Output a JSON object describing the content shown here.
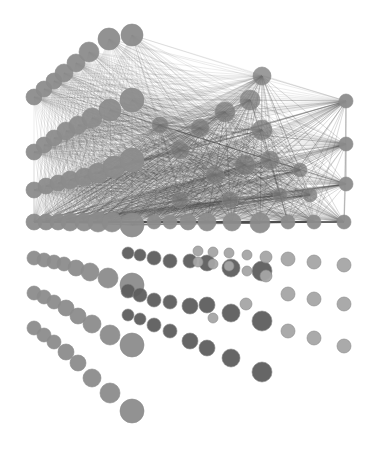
{
  "diagram": {
    "type": "network-graph",
    "width": 376,
    "height": 451,
    "colors": {
      "background": "#ffffff",
      "node_light": "#8c8c8c",
      "node_mid": "#7a7a7a",
      "node_dark": "#5e5e5e",
      "node_faint": "#a5a5a5",
      "edge": "#4a4a4a"
    },
    "node_groups": [
      {
        "name": "fan-row-1",
        "shade": "node_light",
        "nodes": [
          [
            34,
            97,
            8
          ],
          [
            44,
            89,
            8
          ],
          [
            54,
            81,
            8
          ],
          [
            64,
            73,
            9
          ],
          [
            76,
            63,
            9
          ],
          [
            89,
            52,
            10
          ],
          [
            109,
            39,
            11
          ],
          [
            132,
            35,
            11
          ]
        ]
      },
      {
        "name": "fan-row-2",
        "shade": "node_light",
        "nodes": [
          [
            34,
            152,
            8
          ],
          [
            44,
            145,
            8
          ],
          [
            54,
            138,
            8
          ],
          [
            66,
            131,
            9
          ],
          [
            78,
            125,
            9
          ],
          [
            92,
            118,
            10
          ],
          [
            110,
            110,
            11
          ],
          [
            132,
            100,
            12
          ]
        ]
      },
      {
        "name": "fan-row-3",
        "shade": "node_light",
        "nodes": [
          [
            34,
            190,
            8
          ],
          [
            46,
            186,
            8
          ],
          [
            58,
            183,
            8
          ],
          [
            70,
            180,
            9
          ],
          [
            84,
            177,
            9
          ],
          [
            98,
            173,
            10
          ],
          [
            114,
            167,
            11
          ],
          [
            132,
            160,
            12
          ]
        ]
      },
      {
        "name": "base-row",
        "shade": "node_light",
        "nodes": [
          [
            34,
            222,
            8
          ],
          [
            46,
            222,
            8
          ],
          [
            58,
            222,
            8
          ],
          [
            70,
            222,
            9
          ],
          [
            84,
            222,
            9
          ],
          [
            98,
            222,
            10
          ],
          [
            112,
            222,
            10
          ],
          [
            132,
            225,
            12
          ],
          [
            154,
            222,
            7
          ],
          [
            170,
            222,
            7
          ],
          [
            188,
            222,
            8
          ],
          [
            207,
            222,
            9
          ],
          [
            232,
            222,
            9
          ],
          [
            260,
            223,
            10
          ],
          [
            288,
            222,
            7
          ],
          [
            314,
            222,
            7
          ],
          [
            344,
            222,
            7
          ]
        ]
      },
      {
        "name": "hub-top",
        "shade": "node_mid",
        "nodes": [
          [
            262,
            76,
            9
          ]
        ]
      },
      {
        "name": "right-column",
        "shade": "node_light",
        "nodes": [
          [
            346,
            101,
            7
          ],
          [
            346,
            144,
            7
          ],
          [
            346,
            184,
            7
          ]
        ]
      },
      {
        "name": "dense-cluster-inner",
        "shade": "node_mid",
        "nodes": [
          [
            160,
            125,
            8
          ],
          [
            180,
            150,
            9
          ],
          [
            200,
            128,
            9
          ],
          [
            225,
            112,
            10
          ],
          [
            250,
            100,
            10
          ],
          [
            262,
            130,
            10
          ],
          [
            215,
            175,
            9
          ],
          [
            245,
            165,
            10
          ],
          [
            270,
            160,
            9
          ],
          [
            300,
            170,
            7
          ],
          [
            180,
            200,
            8
          ],
          [
            230,
            200,
            8
          ],
          [
            280,
            195,
            7
          ],
          [
            310,
            195,
            7
          ]
        ]
      },
      {
        "name": "lower-fan-1",
        "shade": "node_light",
        "nodes": [
          [
            34,
            258,
            7
          ],
          [
            44,
            260,
            7
          ],
          [
            54,
            262,
            7
          ],
          [
            64,
            264,
            7
          ],
          [
            76,
            268,
            8
          ],
          [
            90,
            272,
            9
          ],
          [
            108,
            278,
            10
          ],
          [
            132,
            285,
            12
          ]
        ]
      },
      {
        "name": "lower-fan-2",
        "shade": "node_light",
        "nodes": [
          [
            34,
            293,
            7
          ],
          [
            44,
            297,
            7
          ],
          [
            54,
            302,
            7
          ],
          [
            66,
            308,
            8
          ],
          [
            78,
            316,
            8
          ],
          [
            92,
            324,
            9
          ],
          [
            110,
            335,
            10
          ],
          [
            132,
            345,
            12
          ]
        ]
      },
      {
        "name": "lower-fan-3",
        "shade": "node_light",
        "nodes": [
          [
            34,
            328,
            7
          ],
          [
            44,
            335,
            7
          ],
          [
            54,
            342,
            7
          ],
          [
            66,
            352,
            8
          ],
          [
            78,
            363,
            8
          ],
          [
            92,
            378,
            9
          ],
          [
            110,
            393,
            10
          ],
          [
            132,
            411,
            12
          ]
        ]
      },
      {
        "name": "grid-row-a",
        "shade": "node_dark",
        "nodes": [
          [
            128,
            253,
            6
          ],
          [
            140,
            255,
            6
          ],
          [
            154,
            258,
            7
          ],
          [
            170,
            261,
            7
          ],
          [
            190,
            261,
            7
          ],
          [
            207,
            263,
            8
          ],
          [
            231,
            268,
            9
          ],
          [
            262,
            271,
            10
          ]
        ]
      },
      {
        "name": "grid-row-b",
        "shade": "node_dark",
        "nodes": [
          [
            128,
            291,
            7
          ],
          [
            140,
            295,
            7
          ],
          [
            154,
            300,
            7
          ],
          [
            170,
            302,
            7
          ],
          [
            190,
            306,
            8
          ],
          [
            207,
            305,
            8
          ],
          [
            231,
            313,
            9
          ],
          [
            262,
            321,
            10
          ]
        ]
      },
      {
        "name": "grid-row-c",
        "shade": "node_dark",
        "nodes": [
          [
            128,
            315,
            6
          ],
          [
            140,
            319,
            6
          ],
          [
            154,
            325,
            7
          ],
          [
            170,
            331,
            7
          ],
          [
            190,
            341,
            8
          ],
          [
            207,
            348,
            8
          ],
          [
            231,
            358,
            9
          ],
          [
            262,
            372,
            10
          ]
        ]
      },
      {
        "name": "grid-faint-upper",
        "shade": "node_faint",
        "nodes": [
          [
            198,
            251,
            5
          ],
          [
            213,
            252,
            5
          ],
          [
            229,
            253,
            5
          ],
          [
            247,
            255,
            5
          ],
          [
            266,
            257,
            6
          ],
          [
            198,
            262,
            5
          ],
          [
            213,
            264,
            5
          ],
          [
            229,
            266,
            5
          ],
          [
            247,
            271,
            5
          ],
          [
            266,
            276,
            6
          ]
        ]
      },
      {
        "name": "grid-faint-right-1",
        "shade": "node_faint",
        "nodes": [
          [
            288,
            259,
            7
          ],
          [
            314,
            262,
            7
          ],
          [
            344,
            265,
            7
          ]
        ]
      },
      {
        "name": "grid-faint-right-2",
        "shade": "node_faint",
        "nodes": [
          [
            288,
            294,
            7
          ],
          [
            314,
            299,
            7
          ],
          [
            344,
            304,
            7
          ]
        ]
      },
      {
        "name": "grid-faint-right-3",
        "shade": "node_faint",
        "nodes": [
          [
            288,
            331,
            7
          ],
          [
            314,
            338,
            7
          ],
          [
            344,
            346,
            7
          ]
        ]
      },
      {
        "name": "grid-faint-mid",
        "shade": "node_faint",
        "nodes": [
          [
            246,
            304,
            6
          ],
          [
            213,
            318,
            5
          ]
        ]
      }
    ],
    "edge_sources": [
      "fan-row-1",
      "fan-row-2",
      "fan-row-3",
      "base-row",
      "hub-top",
      "right-column",
      "dense-cluster-inner"
    ],
    "edge_targets": [
      "hub-top",
      "right-column",
      "dense-cluster-inner",
      "base-row"
    ]
  }
}
